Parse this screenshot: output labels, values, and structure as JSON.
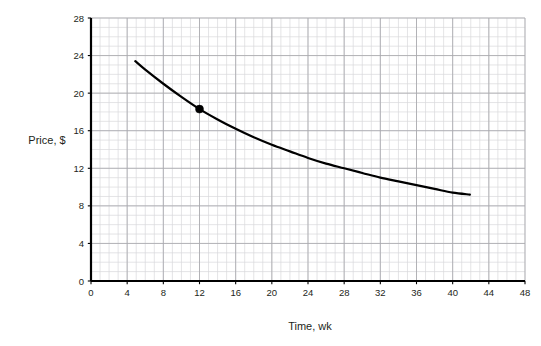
{
  "chart_data": {
    "type": "line",
    "title": "",
    "subtitle": "",
    "xlabel": "Time, wk",
    "ylabel": "Price, $",
    "xlim": [
      0,
      48
    ],
    "ylim": [
      0,
      28
    ],
    "xticks": [
      0,
      4,
      8,
      12,
      16,
      20,
      24,
      28,
      32,
      36,
      40,
      44,
      48
    ],
    "yticks": [
      0,
      4,
      8,
      12,
      16,
      20,
      24,
      28
    ],
    "xtick_labels": [
      "0",
      "4",
      "8",
      "12",
      "16",
      "20",
      "24",
      "28",
      "32",
      "36",
      "40",
      "44",
      "48"
    ],
    "ytick_labels": [
      "0",
      "4",
      "8",
      "12",
      "16",
      "20",
      "24",
      "28"
    ],
    "grid": true,
    "grid_minor_step_x": 1,
    "grid_minor_step_y": 1,
    "grid_major_step_x": 4,
    "grid_major_step_y": 4,
    "legend": "none",
    "series": [
      {
        "name": "Price",
        "color": "#000000",
        "linewidth": 2.2,
        "x": [
          4.9,
          6,
          8,
          10,
          12,
          14,
          16,
          18,
          20,
          22,
          24,
          26,
          28,
          30,
          32,
          34,
          36,
          38,
          40,
          41.9
        ],
        "y": [
          23.4,
          22.5,
          21.0,
          19.6,
          18.3,
          17.2,
          16.2,
          15.3,
          14.5,
          13.8,
          13.1,
          12.5,
          12.0,
          11.5,
          11.0,
          10.6,
          10.2,
          9.8,
          9.4,
          9.2
        ]
      }
    ],
    "markers": [
      {
        "name": "marked-point",
        "x": 12,
        "y": 18.3,
        "color": "#000000",
        "radius": 4
      }
    ]
  },
  "axes": {
    "x_axis_name": "x-axis",
    "y_axis_name": "y-axis"
  }
}
